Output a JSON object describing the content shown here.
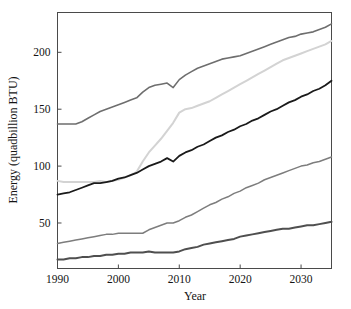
{
  "chart_data": {
    "type": "line",
    "title": "",
    "xlabel": "Year",
    "ylabel": "Energy (quadbillion BTU)",
    "xlim": [
      1990,
      2035
    ],
    "ylim": [
      10,
      235
    ],
    "xticks": [
      1990,
      2000,
      2010,
      2020,
      2030
    ],
    "yticks": [
      50,
      100,
      150,
      200
    ],
    "xtick_labels": [
      "1990",
      "2000",
      "2010",
      "2020",
      "2030"
    ],
    "ytick_labels": [
      "50",
      "100",
      "150",
      "200"
    ],
    "grid": false,
    "legend": "none",
    "frame": "box",
    "series": [
      {
        "name": "series-1-top",
        "color": "#6e6e6e",
        "width": 1.6,
        "x": [
          1990,
          1991,
          1992,
          1993,
          1994,
          1995,
          1996,
          1997,
          1998,
          1999,
          2000,
          2001,
          2002,
          2003,
          2004,
          2005,
          2006,
          2007,
          2008,
          2009,
          2010,
          2011,
          2012,
          2013,
          2014,
          2015,
          2016,
          2017,
          2018,
          2019,
          2020,
          2021,
          2022,
          2023,
          2024,
          2025,
          2026,
          2027,
          2028,
          2029,
          2030,
          2031,
          2032,
          2033,
          2034,
          2035
        ],
        "y": [
          137,
          137,
          137,
          137,
          139,
          142,
          145,
          148,
          150,
          152,
          154,
          156,
          158,
          160,
          165,
          169,
          171,
          172,
          173,
          169,
          176,
          180,
          183,
          186,
          188,
          190,
          192,
          194,
          195,
          196,
          197,
          199,
          201,
          203,
          205,
          207,
          209,
          211,
          213,
          214,
          216,
          217,
          218,
          220,
          222,
          225
        ]
      },
      {
        "name": "series-2-light",
        "color": "#d3d3d3",
        "width": 2.0,
        "x": [
          1990,
          1991,
          1992,
          1993,
          1994,
          1995,
          1996,
          1997,
          1998,
          1999,
          2000,
          2001,
          2002,
          2003,
          2004,
          2005,
          2006,
          2007,
          2008,
          2009,
          2010,
          2011,
          2012,
          2013,
          2014,
          2015,
          2016,
          2017,
          2018,
          2019,
          2020,
          2021,
          2022,
          2023,
          2024,
          2025,
          2026,
          2027,
          2028,
          2029,
          2030,
          2031,
          2032,
          2033,
          2034,
          2035
        ],
        "y": [
          87,
          86,
          86,
          86,
          86,
          86,
          86,
          87,
          86,
          87,
          88,
          90,
          92,
          95,
          104,
          112,
          118,
          124,
          131,
          138,
          147,
          150,
          151,
          153,
          155,
          157,
          160,
          163,
          166,
          169,
          172,
          175,
          178,
          181,
          184,
          187,
          190,
          193,
          195,
          197,
          199,
          201,
          203,
          205,
          207,
          210
        ]
      },
      {
        "name": "series-3-black",
        "color": "#1a1a1a",
        "width": 1.8,
        "x": [
          1990,
          1991,
          1992,
          1993,
          1994,
          1995,
          1996,
          1997,
          1998,
          1999,
          2000,
          2001,
          2002,
          2003,
          2004,
          2005,
          2006,
          2007,
          2008,
          2009,
          2010,
          2011,
          2012,
          2013,
          2014,
          2015,
          2016,
          2017,
          2018,
          2019,
          2020,
          2021,
          2022,
          2023,
          2024,
          2025,
          2026,
          2027,
          2028,
          2029,
          2030,
          2031,
          2032,
          2033,
          2034,
          2035
        ],
        "y": [
          75,
          76,
          77,
          79,
          81,
          83,
          85,
          85,
          86,
          87,
          89,
          90,
          92,
          94,
          97,
          100,
          102,
          104,
          107,
          104,
          109,
          112,
          114,
          117,
          119,
          122,
          125,
          127,
          130,
          132,
          135,
          137,
          140,
          142,
          145,
          148,
          150,
          153,
          156,
          158,
          161,
          163,
          166,
          168,
          171,
          175
        ]
      },
      {
        "name": "series-4-mid",
        "color": "#7d7d7d",
        "width": 1.5,
        "x": [
          1990,
          1991,
          1992,
          1993,
          1994,
          1995,
          1996,
          1997,
          1998,
          1999,
          2000,
          2001,
          2002,
          2003,
          2004,
          2005,
          2006,
          2007,
          2008,
          2009,
          2010,
          2011,
          2012,
          2013,
          2014,
          2015,
          2016,
          2017,
          2018,
          2019,
          2020,
          2021,
          2022,
          2023,
          2024,
          2025,
          2026,
          2027,
          2028,
          2029,
          2030,
          2031,
          2032,
          2033,
          2034,
          2035
        ],
        "y": [
          32,
          33,
          34,
          35,
          36,
          37,
          38,
          39,
          40,
          40,
          41,
          41,
          41,
          41,
          41,
          44,
          46,
          48,
          50,
          50,
          52,
          55,
          57,
          60,
          63,
          66,
          68,
          71,
          73,
          76,
          78,
          81,
          83,
          85,
          88,
          90,
          92,
          94,
          96,
          98,
          100,
          101,
          103,
          104,
          106,
          108
        ]
      },
      {
        "name": "series-5-bottom",
        "color": "#4f4f4f",
        "width": 2.0,
        "x": [
          1990,
          1991,
          1992,
          1993,
          1994,
          1995,
          1996,
          1997,
          1998,
          1999,
          2000,
          2001,
          2002,
          2003,
          2004,
          2005,
          2006,
          2007,
          2008,
          2009,
          2010,
          2011,
          2012,
          2013,
          2014,
          2015,
          2016,
          2017,
          2018,
          2019,
          2020,
          2021,
          2022,
          2023,
          2024,
          2025,
          2026,
          2027,
          2028,
          2029,
          2030,
          2031,
          2032,
          2033,
          2034,
          2035
        ],
        "y": [
          18,
          18,
          19,
          19,
          20,
          20,
          21,
          21,
          22,
          22,
          23,
          23,
          24,
          24,
          24,
          25,
          24,
          24,
          24,
          24,
          25,
          27,
          28,
          29,
          31,
          32,
          33,
          34,
          35,
          36,
          38,
          39,
          40,
          41,
          42,
          43,
          44,
          45,
          45,
          46,
          47,
          48,
          48,
          49,
          50,
          51
        ]
      }
    ]
  }
}
